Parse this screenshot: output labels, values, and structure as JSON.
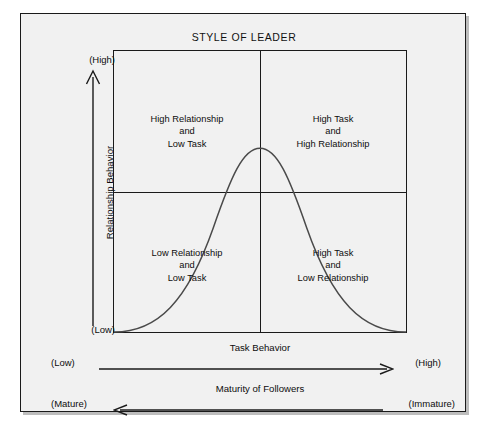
{
  "diagram": {
    "title": "STYLE OF LEADER",
    "colors": {
      "background": "#f1f1f1",
      "page": "#ffffff",
      "line": "#1a1a1a",
      "curve": "#4a4a4a",
      "text": "#0d0d0d"
    },
    "quadrants": [
      {
        "id": "top-left",
        "line1": "High Relationship",
        "line2": "and",
        "line3": "Low Task"
      },
      {
        "id": "top-right",
        "line1": "High Task",
        "line2": "and",
        "line3": "High Relationship"
      },
      {
        "id": "bottom-left",
        "line1": "Low Relationship",
        "line2": "and",
        "line3": "Low Task"
      },
      {
        "id": "bottom-right",
        "line1": "High Task",
        "line2": "and",
        "line3": "Low Relationship"
      }
    ],
    "y_axis": {
      "label": "Relationship Behavior",
      "high": "(High)",
      "low": "(Low)",
      "arrow_direction": "up"
    },
    "x_axis": {
      "label": "Task Behavior",
      "left": "(Low)",
      "right": "(High)",
      "arrow_direction": "right"
    },
    "maturity_axis": {
      "label": "Maturity of Followers",
      "left": "(Mature)",
      "right": "(Immature)",
      "arrow_direction": "left"
    },
    "curve": {
      "name": "bell-curve",
      "description": "Bell-shaped performance curve peaking at the center of the grid"
    }
  }
}
